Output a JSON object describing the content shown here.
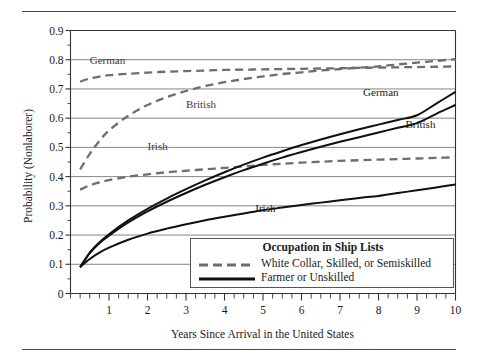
{
  "figure": {
    "has_top_rule": true,
    "has_bottom_rule": true
  },
  "chart_data": {
    "type": "line",
    "title": "",
    "xlabel": "Years Since Arrival in the United States",
    "ylabel": "Probability (Nonlaborer)",
    "xlim": [
      0,
      10
    ],
    "ylim": [
      0,
      0.9
    ],
    "grid": "horizontal",
    "x_ticks": [
      1,
      2,
      3,
      4,
      5,
      6,
      7,
      8,
      9,
      10
    ],
    "x_tick_labels": [
      "1",
      "2",
      "3",
      "4",
      "5",
      "6",
      "7",
      "8",
      "9",
      "10"
    ],
    "x_minor_tick_step": 0.25,
    "y_ticks": [
      0,
      0.1,
      0.2,
      0.3,
      0.4,
      0.5,
      0.6,
      0.7,
      0.8,
      0.9
    ],
    "y_tick_labels": [
      "0",
      "0.1",
      "0.2",
      "0.3",
      "0.4",
      "0.5",
      "0.6",
      "0.7",
      "0.8",
      "0.9"
    ],
    "x": [
      0.25,
      0.5,
      0.75,
      1,
      1.5,
      2,
      2.5,
      3,
      3.5,
      4,
      4.5,
      5,
      5.5,
      6,
      6.5,
      7,
      7.5,
      8,
      8.5,
      9,
      9.5,
      10
    ],
    "series": [
      {
        "name": "German",
        "occupation": "White Collar, Skilled, or Semiskilled",
        "style": "dashed",
        "color": "#6e6e6e",
        "values": [
          0.725,
          0.736,
          0.742,
          0.747,
          0.752,
          0.756,
          0.759,
          0.761,
          0.763,
          0.765,
          0.766,
          0.767,
          0.768,
          0.769,
          0.77,
          0.771,
          0.772,
          0.773,
          0.774,
          0.775,
          0.776,
          0.777
        ]
      },
      {
        "name": "British",
        "occupation": "White Collar, Skilled, or Semiskilled",
        "style": "dashed",
        "color": "#6e6e6e",
        "values": [
          0.425,
          0.478,
          0.522,
          0.558,
          0.608,
          0.645,
          0.672,
          0.693,
          0.71,
          0.723,
          0.734,
          0.743,
          0.751,
          0.757,
          0.763,
          0.768,
          0.773,
          0.777,
          0.784,
          0.79,
          0.796,
          0.802
        ]
      },
      {
        "name": "Irish",
        "occupation": "White Collar, Skilled, or Semiskilled",
        "style": "dashed",
        "color": "#6e6e6e",
        "values": [
          0.355,
          0.37,
          0.38,
          0.388,
          0.4,
          0.408,
          0.415,
          0.42,
          0.425,
          0.43,
          0.435,
          0.44,
          0.444,
          0.448,
          0.451,
          0.454,
          0.456,
          0.458,
          0.46,
          0.462,
          0.464,
          0.466
        ]
      },
      {
        "name": "German",
        "occupation": "Farmer or Unskilled",
        "style": "solid",
        "color": "#101010",
        "values": [
          0.09,
          0.14,
          0.175,
          0.203,
          0.25,
          0.29,
          0.325,
          0.357,
          0.387,
          0.415,
          0.441,
          0.465,
          0.487,
          0.508,
          0.527,
          0.545,
          0.562,
          0.578,
          0.594,
          0.61,
          0.65,
          0.69
        ]
      },
      {
        "name": "British",
        "occupation": "Farmer or Unskilled",
        "style": "solid",
        "color": "#101010",
        "values": [
          0.09,
          0.138,
          0.172,
          0.198,
          0.243,
          0.281,
          0.314,
          0.344,
          0.372,
          0.398,
          0.422,
          0.444,
          0.465,
          0.484,
          0.502,
          0.519,
          0.535,
          0.551,
          0.567,
          0.583,
          0.615,
          0.645
        ]
      },
      {
        "name": "Irish",
        "occupation": "Farmer or Unskilled",
        "style": "solid",
        "color": "#101010",
        "values": [
          0.09,
          0.118,
          0.14,
          0.157,
          0.184,
          0.205,
          0.222,
          0.237,
          0.251,
          0.263,
          0.274,
          0.285,
          0.294,
          0.303,
          0.311,
          0.319,
          0.327,
          0.334,
          0.344,
          0.353,
          0.363,
          0.373
        ]
      }
    ],
    "annotations": [
      {
        "text": "German",
        "x": 0.5,
        "y": 0.795,
        "style": "dashed"
      },
      {
        "text": "British",
        "x": 3.0,
        "y": 0.645,
        "style": "dashed"
      },
      {
        "text": "Irish",
        "x": 2.0,
        "y": 0.5,
        "style": "dashed"
      },
      {
        "text": "German",
        "x": 7.6,
        "y": 0.685,
        "style": "solid"
      },
      {
        "text": "British",
        "x": 8.7,
        "y": 0.575,
        "style": "solid"
      },
      {
        "text": "Irish",
        "x": 4.8,
        "y": 0.29,
        "style": "solid"
      }
    ],
    "legend": {
      "position": "lower-right-inside",
      "title": "Occupation in Ship Lists",
      "entries": [
        {
          "label": "White Collar, Skilled, or Semiskilled",
          "style": "dashed",
          "color": "#6e6e6e"
        },
        {
          "label": "Farmer or Unskilled",
          "style": "solid",
          "color": "#101010"
        }
      ]
    }
  }
}
